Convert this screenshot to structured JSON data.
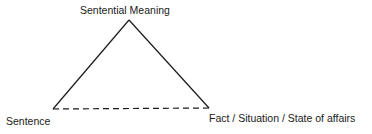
{
  "diagram": {
    "type": "semiotic-triangle",
    "nodes": {
      "top": {
        "label": "Sentential Meaning"
      },
      "left": {
        "label": "Sentence"
      },
      "right": {
        "label": "Fact / Situation / State of affairs"
      }
    },
    "edges": [
      {
        "from": "left",
        "to": "top",
        "style": "solid"
      },
      {
        "from": "top",
        "to": "right",
        "style": "solid"
      },
      {
        "from": "left",
        "to": "right",
        "style": "dashed"
      }
    ],
    "line_color": "#1a1a1a"
  }
}
